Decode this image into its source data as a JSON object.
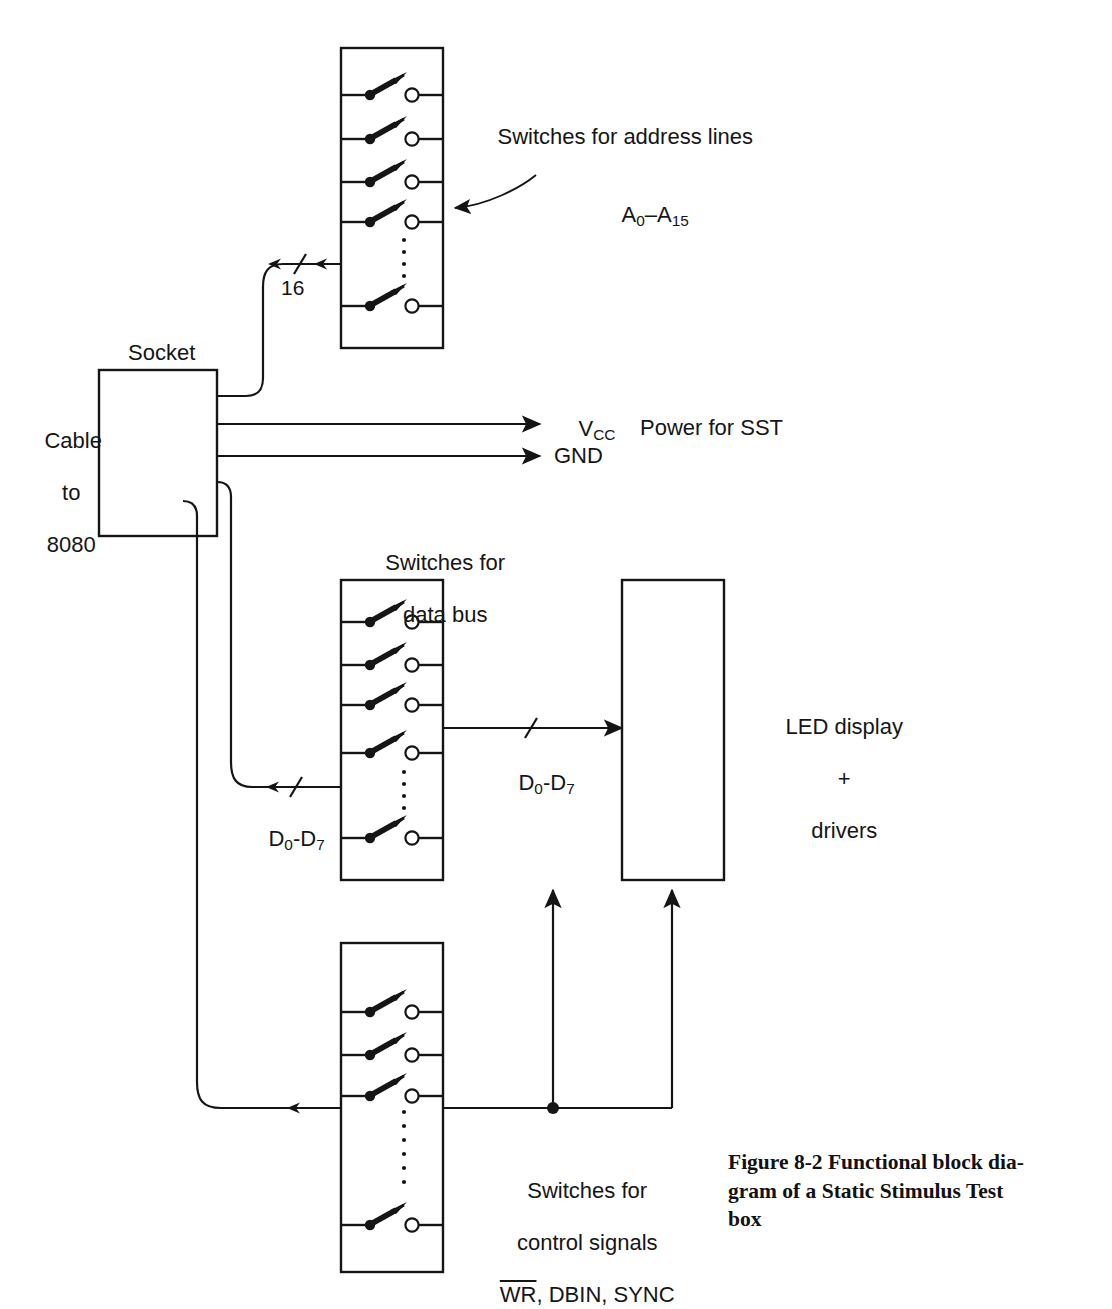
{
  "figure": {
    "caption_line1": "Figure 8-2 Functional block dia-",
    "caption_line2": "gram of a Static Stimulus Test",
    "caption_line3": "box"
  },
  "blocks": {
    "socket": {
      "label": "Socket"
    },
    "cable": {
      "line1": "Cable",
      "line2": "to",
      "line3": "8080"
    },
    "address_switches": {
      "label_line1": "Switches for address lines",
      "label_line2_prefix": "A",
      "label_line2_sub1": "0",
      "label_line2_dash": "–A",
      "label_line2_sub2": "15",
      "switch_count": 5
    },
    "data_switches": {
      "label_line1": "Switches for",
      "label_line2": "data bus",
      "switch_count": 5
    },
    "control_switches": {
      "label_line1": "Switches for",
      "label_line2": "control signals",
      "label_line3_overline": "WR",
      "label_line3_rest": ", DBIN, SYNC",
      "switch_count": 4
    },
    "led_display": {
      "line1": "LED display",
      "line2": "+",
      "line3": "drivers"
    }
  },
  "bus_labels": {
    "address_width": "16",
    "data_left_prefix": "D",
    "data_left_sub1": "0",
    "data_left_dash": "-D",
    "data_left_sub2": "7",
    "data_right_prefix": "D",
    "data_right_sub1": "0",
    "data_right_dash": "-D",
    "data_right_sub2": "7"
  },
  "power": {
    "vcc_prefix": "V",
    "vcc_sub": "CC",
    "gnd": "GND",
    "note": "Power for SST"
  },
  "colors": {
    "ink": "#151515",
    "paper": "#ffffff"
  }
}
